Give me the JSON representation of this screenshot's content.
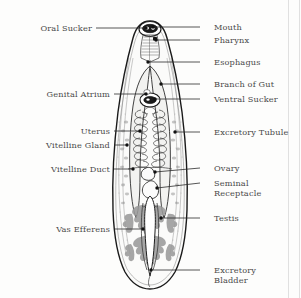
{
  "figure": {
    "background_color": "#fdfdfc",
    "label_color": "#4a4a4a",
    "leader_color": "#2b2b2b",
    "outline_color": "#1a1a1a",
    "testis_fill": "#9a9a9a",
    "vitelline_fill": "#8e8e8e"
  },
  "labels_left": [
    {
      "id": "oral-sucker",
      "text": "Oral Sucker",
      "text_x": 92,
      "text_y": 31,
      "line_x1": 96,
      "line_y1": 28,
      "line_x2": 146,
      "line_y2": 28,
      "dot_x": 146,
      "dot_y": 28
    },
    {
      "id": "genital-atrium",
      "text": "Genital Atrium",
      "text_x": 110,
      "text_y": 97,
      "line_x1": 114,
      "line_y1": 94,
      "line_x2": 146,
      "line_y2": 94,
      "dot_x": 146,
      "dot_y": 94
    },
    {
      "id": "uterus",
      "text": "Uterus",
      "text_x": 110,
      "text_y": 134,
      "line_x1": 114,
      "line_y1": 131,
      "line_x2": 140,
      "line_y2": 131,
      "dot_x": 140,
      "dot_y": 131
    },
    {
      "id": "vitelline-gland",
      "text": "Vitelline Gland",
      "text_x": 110,
      "text_y": 148,
      "line_x1": 114,
      "line_y1": 145,
      "line_x2": 127,
      "line_y2": 145,
      "dot_x": 127,
      "dot_y": 145
    },
    {
      "id": "vitelline-duct",
      "text": "Vitelline Duct",
      "text_x": 110,
      "text_y": 172,
      "line_x1": 114,
      "line_y1": 169,
      "line_x2": 133,
      "line_y2": 169,
      "dot_x": 133,
      "dot_y": 169
    },
    {
      "id": "vas-efferens",
      "text": "Vas Efferens",
      "text_x": 110,
      "text_y": 232,
      "line_x1": 114,
      "line_y1": 229,
      "line_x2": 143,
      "line_y2": 229,
      "dot_x": 143,
      "dot_y": 229
    }
  ],
  "labels_right": [
    {
      "id": "mouth",
      "text": "Mouth",
      "text_x": 214,
      "text_y": 30,
      "line_x1": 200,
      "line_y1": 27,
      "line_x2": 153,
      "line_y2": 27,
      "dot_x": 153,
      "dot_y": 27
    },
    {
      "id": "pharynx",
      "text": "Pharynx",
      "text_x": 214,
      "text_y": 43,
      "line_x1": 200,
      "line_y1": 40,
      "line_x2": 156,
      "line_y2": 40,
      "dot_x": 156,
      "dot_y": 40
    },
    {
      "id": "esophagus",
      "text": "Esophagus",
      "text_x": 214,
      "text_y": 65,
      "line_x1": 200,
      "line_y1": 62,
      "line_x2": 148,
      "line_y2": 62,
      "dot_x": 148,
      "dot_y": 62
    },
    {
      "id": "branch-of-gut",
      "text": "Branch of Gut",
      "text_x": 214,
      "text_y": 87,
      "line_x1": 200,
      "line_y1": 84,
      "line_x2": 161,
      "line_y2": 84,
      "dot_x": 161,
      "dot_y": 84
    },
    {
      "id": "ventral-sucker",
      "text": "Ventral Sucker",
      "text_x": 214,
      "text_y": 102,
      "line_x1": 200,
      "line_y1": 99,
      "line_x2": 155,
      "line_y2": 99,
      "dot_x": 155,
      "dot_y": 99
    },
    {
      "id": "excretory-tubule",
      "text": "Excretory Tubule",
      "text_x": 214,
      "text_y": 135,
      "line_x1": 200,
      "line_y1": 132,
      "line_x2": 175,
      "line_y2": 132,
      "dot_x": 175,
      "dot_y": 132
    },
    {
      "id": "ovary",
      "text": "Ovary",
      "text_x": 214,
      "text_y": 171,
      "line_x1": 200,
      "line_y1": 168,
      "line_x2": 155,
      "line_y2": 172,
      "dot_x": 155,
      "dot_y": 172
    },
    {
      "id": "testis",
      "text": "Testis",
      "text_x": 214,
      "text_y": 221,
      "line_x1": 200,
      "line_y1": 218,
      "line_x2": 161,
      "line_y2": 218,
      "dot_x": 161,
      "dot_y": 218
    },
    {
      "id": "excretory-bladder",
      "text": "Excretory Bladder",
      "text_x": 214,
      "text_y": 273,
      "line_x1": 200,
      "line_y1": 270,
      "line_x2": 151,
      "line_y2": 270,
      "dot_x": 151,
      "dot_y": 270
    }
  ],
  "labels_right_multiline": [
    {
      "id": "seminal-receptacle",
      "line1": "Seminal",
      "line2": "Receptacle",
      "text_x": 214,
      "text_y1": 186,
      "text_y2": 196,
      "line_x1": 200,
      "line_y1": 183,
      "line_x2": 157,
      "line_y2": 188,
      "dot_x": 157,
      "dot_y": 188
    },
    {
      "id": "excretory-bladder-2",
      "line1": "Excretory",
      "line2": "Bladder",
      "text_x": 214,
      "text_y1": 273,
      "text_y2": 283
    }
  ]
}
